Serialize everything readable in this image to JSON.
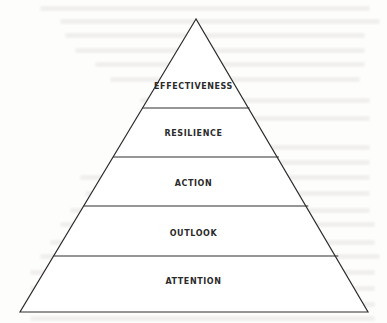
{
  "diagram": {
    "type": "pyramid",
    "levels_top_to_bottom": [
      {
        "label": "EFFECTIVENESS"
      },
      {
        "label": "RESILIENCE"
      },
      {
        "label": "ACTION"
      },
      {
        "label": "OUTLOOK"
      },
      {
        "label": "ATTENTION"
      }
    ],
    "colors": {
      "stroke": "#2e2e2e",
      "fill": "#ffffff",
      "text": "#2b2b2b",
      "background": "#fdfdfc"
    }
  }
}
